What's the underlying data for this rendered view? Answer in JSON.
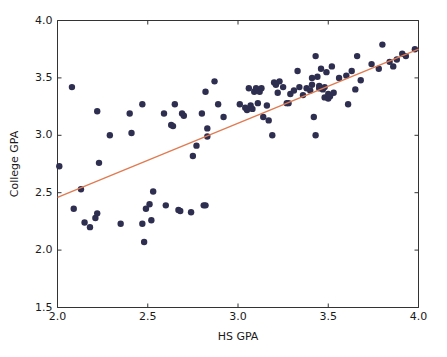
{
  "chart_data": {
    "type": "scatter",
    "title": "",
    "xlabel": "HS GPA",
    "ylabel": "College GPA",
    "xlim": [
      2.0,
      4.0
    ],
    "ylim": [
      1.5,
      4.0
    ],
    "xticks": [
      2.0,
      2.5,
      3.0,
      3.5,
      4.0
    ],
    "yticks": [
      1.5,
      2.0,
      2.5,
      3.0,
      3.5,
      4.0
    ],
    "xtick_labels": [
      "2.0",
      "2.5",
      "3.0",
      "3.5",
      "4.0"
    ],
    "ytick_labels": [
      "1.5",
      "2.0",
      "2.5",
      "3.0",
      "3.5",
      "4.0"
    ],
    "grid": false,
    "legend": null,
    "marker_color": "#2e2e50",
    "marker_size": 3.2,
    "series": [
      {
        "name": "students",
        "type": "scatter",
        "points": [
          [
            2.01,
            2.73
          ],
          [
            2.08,
            3.42
          ],
          [
            2.09,
            2.36
          ],
          [
            2.13,
            2.53
          ],
          [
            2.15,
            2.24
          ],
          [
            2.18,
            2.2
          ],
          [
            2.21,
            2.28
          ],
          [
            2.22,
            3.21
          ],
          [
            2.22,
            2.32
          ],
          [
            2.23,
            2.76
          ],
          [
            2.29,
            3.0
          ],
          [
            2.35,
            2.23
          ],
          [
            2.4,
            3.19
          ],
          [
            2.41,
            3.02
          ],
          [
            2.47,
            3.27
          ],
          [
            2.47,
            2.23
          ],
          [
            2.48,
            2.07
          ],
          [
            2.49,
            2.36
          ],
          [
            2.51,
            2.4
          ],
          [
            2.52,
            2.26
          ],
          [
            2.53,
            2.51
          ],
          [
            2.59,
            3.19
          ],
          [
            2.6,
            2.39
          ],
          [
            2.63,
            3.09
          ],
          [
            2.64,
            3.08
          ],
          [
            2.65,
            3.27
          ],
          [
            2.67,
            2.35
          ],
          [
            2.68,
            2.34
          ],
          [
            2.69,
            3.19
          ],
          [
            2.7,
            3.17
          ],
          [
            2.74,
            2.33
          ],
          [
            2.75,
            2.82
          ],
          [
            2.77,
            2.91
          ],
          [
            2.8,
            3.19
          ],
          [
            2.81,
            2.39
          ],
          [
            2.82,
            3.38
          ],
          [
            2.82,
            2.39
          ],
          [
            2.83,
            3.06
          ],
          [
            2.83,
            2.99
          ],
          [
            2.87,
            3.47
          ],
          [
            2.89,
            3.27
          ],
          [
            2.92,
            3.16
          ],
          [
            3.01,
            3.27
          ],
          [
            3.04,
            3.24
          ],
          [
            3.05,
            3.22
          ],
          [
            3.06,
            3.41
          ],
          [
            3.07,
            3.26
          ],
          [
            3.08,
            3.23
          ],
          [
            3.09,
            3.38
          ],
          [
            3.1,
            3.41
          ],
          [
            3.11,
            3.28
          ],
          [
            3.12,
            3.38
          ],
          [
            3.13,
            3.41
          ],
          [
            3.14,
            3.16
          ],
          [
            3.16,
            3.26
          ],
          [
            3.17,
            3.13
          ],
          [
            3.19,
            3.0
          ],
          [
            3.2,
            3.46
          ],
          [
            3.21,
            3.45
          ],
          [
            3.21,
            3.44
          ],
          [
            3.22,
            3.37
          ],
          [
            3.23,
            3.47
          ],
          [
            3.25,
            3.42
          ],
          [
            3.27,
            3.28
          ],
          [
            3.28,
            3.28
          ],
          [
            3.29,
            3.36
          ],
          [
            3.31,
            3.39
          ],
          [
            3.33,
            3.56
          ],
          [
            3.34,
            3.42
          ],
          [
            3.36,
            3.35
          ],
          [
            3.38,
            3.41
          ],
          [
            3.4,
            3.39
          ],
          [
            3.41,
            3.5
          ],
          [
            3.41,
            3.44
          ],
          [
            3.42,
            3.16
          ],
          [
            3.43,
            3.69
          ],
          [
            3.43,
            3.0
          ],
          [
            3.44,
            3.51
          ],
          [
            3.45,
            3.43
          ],
          [
            3.45,
            3.41
          ],
          [
            3.46,
            3.58
          ],
          [
            3.47,
            3.4
          ],
          [
            3.48,
            3.42
          ],
          [
            3.48,
            3.33
          ],
          [
            3.49,
            3.55
          ],
          [
            3.5,
            3.32
          ],
          [
            3.5,
            3.36
          ],
          [
            3.51,
            3.34
          ],
          [
            3.52,
            3.6
          ],
          [
            3.53,
            3.37
          ],
          [
            3.56,
            3.5
          ],
          [
            3.6,
            3.52
          ],
          [
            3.61,
            3.27
          ],
          [
            3.63,
            3.56
          ],
          [
            3.65,
            3.4
          ],
          [
            3.66,
            3.69
          ],
          [
            3.68,
            3.48
          ],
          [
            3.74,
            3.62
          ],
          [
            3.78,
            3.58
          ],
          [
            3.8,
            3.79
          ],
          [
            3.84,
            3.64
          ],
          [
            3.86,
            3.6
          ],
          [
            3.88,
            3.66
          ],
          [
            3.91,
            3.71
          ],
          [
            3.93,
            3.69
          ],
          [
            3.98,
            3.75
          ]
        ]
      },
      {
        "name": "regression-line",
        "type": "line",
        "color": "#e07a51",
        "endpoints": [
          [
            2.0,
            2.46
          ],
          [
            4.0,
            3.75
          ]
        ],
        "slope": 0.645,
        "intercept": 1.17
      }
    ]
  }
}
